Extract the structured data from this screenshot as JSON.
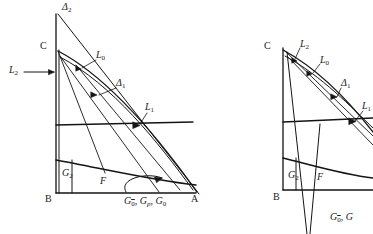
{
  "figure": {
    "kind": "geometric-diagram",
    "stroke_color": "#141414",
    "background_color": "#ffffff",
    "panels": [
      {
        "id": "left-panel",
        "name": "left-diagram",
        "vertices": {
          "C": "C",
          "B": "B",
          "A": "A"
        },
        "labels": [
          {
            "key": "delta2",
            "text": "Δ2",
            "base": "Δ",
            "sub": "2",
            "x": 62,
            "y": 4
          },
          {
            "key": "C",
            "text": "C",
            "base": "C",
            "sub": "",
            "x": 40,
            "y": 42
          },
          {
            "key": "L0",
            "text": "L0",
            "base": "L",
            "sub": "0",
            "x": 96,
            "y": 52
          },
          {
            "key": "L2",
            "text": "L2",
            "base": "L",
            "sub": "2",
            "x": 10,
            "y": 68
          },
          {
            "key": "delta1",
            "text": "Δ1",
            "base": "Δ",
            "sub": "1",
            "x": 116,
            "y": 80
          },
          {
            "key": "L1",
            "text": "L1",
            "base": "L",
            "sub": "1",
            "x": 144,
            "y": 104
          },
          {
            "key": "G2",
            "text": "G2",
            "base": "G",
            "sub": "2",
            "x": 62,
            "y": 170
          },
          {
            "key": "F",
            "text": "F",
            "base": "F",
            "sub": "",
            "x": 100,
            "y": 178
          },
          {
            "key": "B",
            "text": "B",
            "base": "B",
            "sub": "",
            "x": 46,
            "y": 194
          },
          {
            "key": "A",
            "text": "A",
            "base": "A",
            "sub": "",
            "x": 192,
            "y": 194
          },
          {
            "key": "G-group",
            "text": "G0̄, Gp, G0",
            "base": "",
            "sub": "",
            "x": 124,
            "y": 195
          }
        ],
        "group_label_parts": {
          "first_base": "G",
          "first_sub": "0",
          "first_sub_overline": true,
          "second_base": "G",
          "second_sub": "p",
          "third_base": "G",
          "third_sub": "0",
          "separator": ", "
        }
      },
      {
        "id": "right-panel",
        "name": "right-diagram",
        "vertices": {
          "C": "C",
          "B": "B"
        },
        "labels": [
          {
            "key": "C",
            "text": "C",
            "base": "C",
            "sub": "",
            "x": 264,
            "y": 42
          },
          {
            "key": "L2",
            "text": "L2",
            "base": "L",
            "sub": "2",
            "x": 300,
            "y": 41
          },
          {
            "key": "L0",
            "text": "L0",
            "base": "L",
            "sub": "0",
            "x": 320,
            "y": 57
          },
          {
            "key": "delta1",
            "text": "Δ1",
            "base": "Δ",
            "sub": "1",
            "x": 341,
            "y": 80
          },
          {
            "key": "L1",
            "text": "L1",
            "base": "L",
            "sub": "1",
            "x": 362,
            "y": 103
          },
          {
            "key": "G2",
            "text": "G2",
            "base": "G",
            "sub": "2",
            "x": 289,
            "y": 172
          },
          {
            "key": "F",
            "text": "F",
            "base": "F",
            "sub": "",
            "x": 317,
            "y": 174
          },
          {
            "key": "B",
            "text": "B",
            "base": "B",
            "sub": "",
            "x": 274,
            "y": 192
          },
          {
            "key": "G-group",
            "text": "G0̄, G",
            "base": "",
            "sub": "",
            "x": 330,
            "y": 211
          }
        ],
        "group_label_parts": {
          "first_base": "G",
          "first_sub": "0",
          "first_sub_overline": true,
          "second_base": "G",
          "separator": ", "
        }
      }
    ]
  }
}
